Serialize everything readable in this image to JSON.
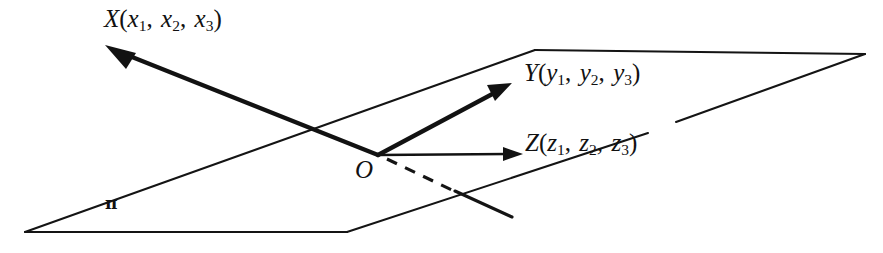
{
  "figure": {
    "name": "three-vectors-from-origin-in-plane",
    "background_color": "#ffffff",
    "ink_color": "#111111",
    "width": 883,
    "height": 253
  },
  "labels": {
    "vector_x": {
      "symbol": "X",
      "open_paren": "(",
      "close_paren": ")",
      "comma": ",",
      "components": [
        "x",
        "x",
        "x"
      ],
      "subscripts": [
        "1",
        "2",
        "3"
      ],
      "full_text": "X(x1, x2, x3)"
    },
    "vector_y": {
      "symbol": "Y",
      "open_paren": "(",
      "close_paren": ")",
      "comma": ",",
      "components": [
        "y",
        "y",
        "y"
      ],
      "subscripts": [
        "1",
        "2",
        "3"
      ],
      "full_text": "Y(y1, y2, y3)"
    },
    "vector_z": {
      "symbol": "Z",
      "open_paren": "(",
      "close_paren": ")",
      "comma": ",",
      "components": [
        "z",
        "z",
        "z"
      ],
      "subscripts": [
        "1",
        "2",
        "3"
      ],
      "full_text": "Z(z1, z2, z3)"
    },
    "origin": {
      "symbol": "O"
    },
    "plane": {
      "symbol": "π"
    }
  },
  "geometry": {
    "origin_point": [
      378,
      155
    ],
    "plane_polygon": [
      [
        535,
        50
      ],
      [
        865,
        54
      ],
      [
        347,
        232
      ],
      [
        25,
        232
      ]
    ],
    "vector_x_arrow": {
      "from": [
        378,
        155
      ],
      "to": [
        108,
        47
      ],
      "style": "solid-thick-arrow"
    },
    "vector_y_arrow": {
      "from": [
        378,
        155
      ],
      "to": [
        510,
        84
      ],
      "style": "solid-thick-arrow"
    },
    "vector_z_arrow": {
      "from": [
        378,
        155
      ],
      "to": [
        521,
        154
      ],
      "style": "solid-thick-arrow"
    },
    "hidden_line_dashed": {
      "from": [
        386,
        159
      ],
      "to": [
        455,
        191
      ],
      "style": "dashed"
    },
    "visible_line_solid": {
      "from": [
        455,
        191
      ],
      "to": [
        512,
        216
      ],
      "style": "solid"
    }
  }
}
